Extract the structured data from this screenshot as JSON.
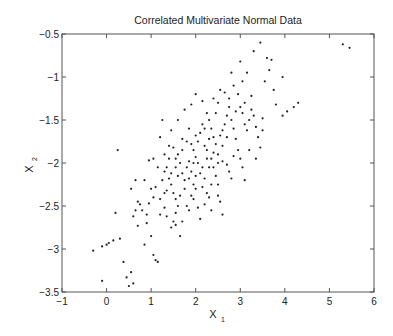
{
  "chart_data": {
    "type": "scatter",
    "title": "Correlated Multivariate Normal Data",
    "xlabel": "X",
    "xlabel_subscript": "1",
    "ylabel": "X",
    "ylabel_subscript": "2",
    "xlim": [
      -1,
      6
    ],
    "ylim": [
      -3.5,
      -0.5
    ],
    "xticks": [
      -1,
      0,
      1,
      2,
      3,
      4,
      5,
      6
    ],
    "xtick_labels": [
      "−1",
      "0",
      "1",
      "2",
      "3",
      "4",
      "5",
      "6"
    ],
    "yticks": [
      -0.5,
      -1,
      -1.5,
      -2,
      -2.5,
      -3,
      -3.5
    ],
    "ytick_labels": [
      "−0.5",
      "−1",
      "−1.5",
      "−2",
      "−2.5",
      "−3",
      "−3.5"
    ],
    "grid": false,
    "legend": null,
    "marker": "dot",
    "marker_color": "#222222",
    "series": [
      {
        "name": "samples",
        "points": [
          [
            -0.3,
            -3.02
          ],
          [
            -0.1,
            -2.97
          ],
          [
            0.05,
            -2.93
          ],
          [
            0.0,
            -2.95
          ],
          [
            0.15,
            -2.9
          ],
          [
            0.3,
            -2.88
          ],
          [
            0.2,
            -2.58
          ],
          [
            0.38,
            -3.15
          ],
          [
            0.45,
            -3.33
          ],
          [
            0.55,
            -3.27
          ],
          [
            0.5,
            -3.43
          ],
          [
            0.6,
            -3.4
          ],
          [
            -0.1,
            -3.37
          ],
          [
            0.6,
            -2.62
          ],
          [
            0.55,
            -2.3
          ],
          [
            0.65,
            -2.2
          ],
          [
            0.75,
            -2.48
          ],
          [
            0.8,
            -2.55
          ],
          [
            0.7,
            -2.73
          ],
          [
            0.9,
            -2.7
          ],
          [
            0.85,
            -2.95
          ],
          [
            1.0,
            -2.85
          ],
          [
            1.05,
            -3.07
          ],
          [
            1.1,
            -3.13
          ],
          [
            1.15,
            -3.15
          ],
          [
            0.95,
            -2.47
          ],
          [
            1.05,
            -2.4
          ],
          [
            1.2,
            -2.42
          ],
          [
            1.3,
            -2.52
          ],
          [
            1.1,
            -2.28
          ],
          [
            1.35,
            -2.62
          ],
          [
            1.45,
            -2.75
          ],
          [
            1.5,
            -2.68
          ],
          [
            1.55,
            -2.72
          ],
          [
            1.7,
            -2.68
          ],
          [
            1.65,
            -2.85
          ],
          [
            0.25,
            -1.85
          ],
          [
            0.95,
            -1.97
          ],
          [
            1.2,
            -1.7
          ],
          [
            1.25,
            -1.5
          ],
          [
            1.3,
            -1.9
          ],
          [
            1.35,
            -2.05
          ],
          [
            1.3,
            -2.1
          ],
          [
            1.4,
            -2.18
          ],
          [
            1.45,
            -2.25
          ],
          [
            1.5,
            -2.35
          ],
          [
            1.55,
            -2.42
          ],
          [
            1.6,
            -2.5
          ],
          [
            1.4,
            -1.8
          ],
          [
            1.5,
            -1.82
          ],
          [
            1.55,
            -1.95
          ],
          [
            1.6,
            -1.9
          ],
          [
            1.65,
            -2.0
          ],
          [
            1.7,
            -2.12
          ],
          [
            1.75,
            -2.2
          ],
          [
            1.8,
            -2.05
          ],
          [
            1.85,
            -1.98
          ],
          [
            1.9,
            -2.1
          ],
          [
            1.95,
            -2.25
          ],
          [
            2.0,
            -2.3
          ],
          [
            1.7,
            -1.72
          ],
          [
            1.8,
            -1.75
          ],
          [
            1.85,
            -1.6
          ],
          [
            1.9,
            -1.78
          ],
          [
            1.95,
            -1.85
          ],
          [
            2.0,
            -1.93
          ],
          [
            2.05,
            -2.0
          ],
          [
            2.1,
            -2.12
          ],
          [
            2.15,
            -2.05
          ],
          [
            2.2,
            -2.18
          ],
          [
            2.25,
            -2.35
          ],
          [
            2.3,
            -2.4
          ],
          [
            2.0,
            -1.68
          ],
          [
            2.1,
            -1.65
          ],
          [
            2.15,
            -1.55
          ],
          [
            2.2,
            -1.8
          ],
          [
            2.25,
            -1.85
          ],
          [
            2.35,
            -1.95
          ],
          [
            2.4,
            -2.05
          ],
          [
            2.45,
            -2.15
          ],
          [
            2.5,
            -2.25
          ],
          [
            2.55,
            -2.45
          ],
          [
            2.6,
            -2.6
          ],
          [
            2.05,
            -2.52
          ],
          [
            1.45,
            -1.62
          ],
          [
            1.6,
            -1.5
          ],
          [
            1.75,
            -1.38
          ],
          [
            1.9,
            -1.32
          ],
          [
            2.0,
            -1.2
          ],
          [
            2.15,
            -1.28
          ],
          [
            2.25,
            -1.42
          ],
          [
            2.3,
            -1.5
          ],
          [
            2.35,
            -1.6
          ],
          [
            2.4,
            -1.7
          ],
          [
            2.45,
            -1.78
          ],
          [
            2.5,
            -1.9
          ],
          [
            2.55,
            -1.68
          ],
          [
            2.6,
            -1.62
          ],
          [
            2.65,
            -1.55
          ],
          [
            2.7,
            -1.45
          ],
          [
            2.75,
            -1.35
          ],
          [
            2.8,
            -1.5
          ],
          [
            2.85,
            -1.6
          ],
          [
            2.9,
            -1.72
          ],
          [
            2.95,
            -1.85
          ],
          [
            3.0,
            -1.95
          ],
          [
            3.05,
            -2.05
          ],
          [
            3.1,
            -2.2
          ],
          [
            2.6,
            -1.98
          ],
          [
            2.7,
            -2.02
          ],
          [
            2.75,
            -2.1
          ],
          [
            2.8,
            -2.18
          ],
          [
            2.85,
            -1.92
          ],
          [
            2.5,
            -2.0
          ],
          [
            2.4,
            -1.25
          ],
          [
            2.5,
            -1.3
          ],
          [
            2.55,
            -1.15
          ],
          [
            2.65,
            -1.18
          ],
          [
            2.75,
            -1.25
          ],
          [
            2.85,
            -1.1
          ],
          [
            2.95,
            -1.2
          ],
          [
            3.0,
            -1.35
          ],
          [
            3.05,
            -1.42
          ],
          [
            3.1,
            -1.55
          ],
          [
            3.15,
            -1.62
          ],
          [
            3.2,
            -1.5
          ],
          [
            3.25,
            -1.38
          ],
          [
            3.3,
            -1.45
          ],
          [
            3.35,
            -1.58
          ],
          [
            3.4,
            -1.7
          ],
          [
            3.45,
            -1.82
          ],
          [
            3.5,
            -1.62
          ],
          [
            3.0,
            -0.82
          ],
          [
            3.3,
            -0.7
          ],
          [
            3.6,
            -0.78
          ],
          [
            3.7,
            -0.8
          ],
          [
            3.55,
            -1.05
          ],
          [
            3.75,
            -1.15
          ],
          [
            3.2,
            -1.85
          ],
          [
            3.35,
            -1.95
          ],
          [
            3.5,
            -1.48
          ],
          [
            3.8,
            -1.32
          ],
          [
            3.95,
            -1.45
          ],
          [
            4.05,
            -1.4
          ],
          [
            4.2,
            -1.35
          ],
          [
            4.3,
            -1.3
          ],
          [
            3.95,
            -1.0
          ],
          [
            3.65,
            -0.92
          ],
          [
            3.15,
            -0.95
          ],
          [
            3.45,
            -0.6
          ],
          [
            5.3,
            -0.62
          ],
          [
            5.45,
            -0.66
          ],
          [
            1.95,
            -2.42
          ],
          [
            1.85,
            -2.55
          ],
          [
            2.1,
            -2.65
          ],
          [
            2.2,
            -2.48
          ],
          [
            1.25,
            -2.2
          ],
          [
            1.15,
            -2.05
          ],
          [
            1.6,
            -2.15
          ],
          [
            1.75,
            -2.3
          ],
          [
            1.9,
            -2.38
          ],
          [
            2.35,
            -2.25
          ],
          [
            1.05,
            -1.95
          ],
          [
            1.4,
            -1.95
          ],
          [
            1.7,
            -1.85
          ],
          [
            2.05,
            -1.75
          ],
          [
            2.3,
            -1.72
          ],
          [
            2.6,
            -1.8
          ],
          [
            2.7,
            -1.7
          ],
          [
            2.9,
            -1.4
          ],
          [
            3.1,
            -1.3
          ],
          [
            3.25,
            -1.22
          ],
          [
            2.45,
            -1.42
          ],
          [
            2.2,
            -1.6
          ],
          [
            1.8,
            -2.5
          ],
          [
            1.55,
            -2.58
          ],
          [
            1.3,
            -2.35
          ],
          [
            0.9,
            -2.6
          ],
          [
            0.7,
            -2.45
          ],
          [
            1.0,
            -2.3
          ],
          [
            2.8,
            -0.95
          ],
          [
            3.05,
            -1.05
          ],
          [
            2.35,
            -2.55
          ],
          [
            2.5,
            -2.38
          ],
          [
            2.15,
            -2.28
          ],
          [
            1.65,
            -2.38
          ],
          [
            1.95,
            -2.0
          ],
          [
            2.0,
            -2.15
          ],
          [
            2.25,
            -1.95
          ],
          [
            2.3,
            -2.05
          ],
          [
            2.4,
            -1.88
          ],
          [
            1.85,
            -2.18
          ],
          [
            1.55,
            -2.05
          ],
          [
            1.45,
            -2.12
          ],
          [
            1.35,
            -2.32
          ],
          [
            1.2,
            -2.6
          ],
          [
            0.85,
            -2.2
          ],
          [
            0.65,
            -2.55
          ]
        ]
      }
    ]
  },
  "figure": {
    "background": "#ffffff",
    "axes_color": "#555555",
    "text_color": "#222222"
  }
}
